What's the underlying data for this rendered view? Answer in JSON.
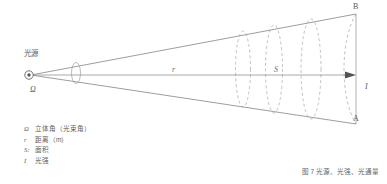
{
  "diagram": {
    "source_label": "光源",
    "omega_label": "Ω",
    "axis_distance_label": "r",
    "area_label": "S",
    "top_point_label": "B",
    "bottom_point_label": "A",
    "intensity_label": "I",
    "colors": {
      "line": "#6f7478",
      "dashed": "#9aa0a4",
      "text": "#55595d",
      "background": "#ffffff"
    }
  },
  "legend": {
    "rows": [
      {
        "symbol": "Ω",
        "text": "立体角（光束角）"
      },
      {
        "symbol": "r",
        "text": "距离（m）"
      },
      {
        "symbol": "S:",
        "text": "面积"
      },
      {
        "symbol": "I",
        "text": "光强"
      }
    ]
  },
  "caption": {
    "text": "图 7 光源、光强、光通量"
  }
}
